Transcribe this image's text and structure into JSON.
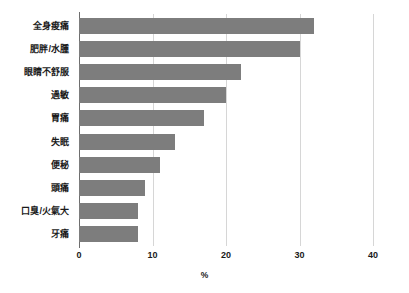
{
  "chart_data": {
    "type": "bar",
    "orientation": "horizontal",
    "title": "",
    "subtitle": "",
    "xlabel": "%",
    "ylabel": "",
    "categories": [
      "全身痠痛",
      "肥胖/水腫",
      "眼睛不舒服",
      "過敏",
      "胃痛",
      "失眠",
      "便秘",
      "頭痛",
      "口臭/火氣大",
      "牙痛"
    ],
    "values": [
      32,
      30,
      22,
      20,
      17,
      13,
      11,
      9,
      8,
      8
    ],
    "xlim": [
      0,
      40
    ],
    "xticks": [
      0,
      10,
      20,
      30,
      40
    ],
    "xtick_labels": [
      "0",
      "10",
      "20",
      "30",
      "40"
    ],
    "grid": true,
    "grid_axis": "x",
    "legend": false,
    "bar_color": "#7d7d7d",
    "grid_color": "#d6d6d6",
    "axis_color": "#6e6e6e",
    "background_color": "#ffffff"
  }
}
